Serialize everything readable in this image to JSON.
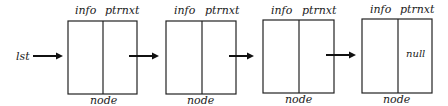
{
  "diagram": {
    "type": "linked-list",
    "pointer_label": "lst",
    "field_labels": {
      "info": "info",
      "next": "ptrnxt"
    },
    "node_label": "node",
    "nodes": [
      {
        "info": "",
        "next": ""
      },
      {
        "info": "",
        "next": ""
      },
      {
        "info": "",
        "next": ""
      },
      {
        "info": "",
        "next": "null"
      }
    ],
    "colors": {
      "stroke": "#222222",
      "background": "#ffffff"
    }
  }
}
